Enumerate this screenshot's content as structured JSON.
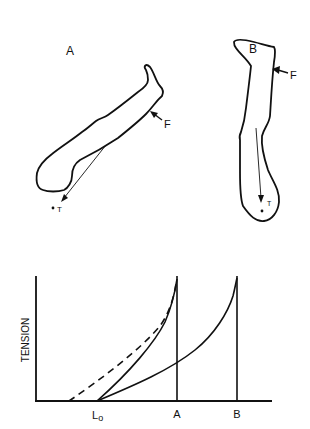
{
  "figure": {
    "panel_a": {
      "label": "A",
      "force_label": "F",
      "tendon_label": "T"
    },
    "panel_b": {
      "label": "B",
      "force_label": "F",
      "tendon_label": "T"
    },
    "graph": {
      "ylabel": "TENSION",
      "x_tick_labels": {
        "l0_main": "L",
        "l0_sub": "o",
        "a": "A",
        "b": "B"
      },
      "curves": [
        {
          "name": "dashed-curve",
          "style": "dashed",
          "start": "before L0",
          "end": "A"
        },
        {
          "name": "solid-curve-a",
          "style": "solid",
          "start": "L0",
          "end": "A"
        },
        {
          "name": "solid-curve-b",
          "style": "solid",
          "start": "L0",
          "end": "B"
        }
      ]
    }
  },
  "colors": {
    "ink": "#111111",
    "background": "#ffffff"
  }
}
